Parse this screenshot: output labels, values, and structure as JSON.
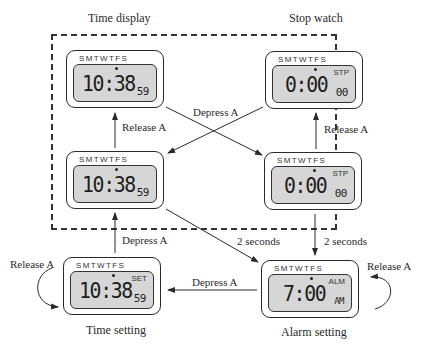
{
  "diagram": {
    "title_left": "Time display",
    "title_right": "Stop watch",
    "caption_time_setting": "Time setting",
    "caption_alarm_setting": "Alarm setting"
  },
  "watches": {
    "time_display": {
      "days": "SMTWTFS",
      "mode": "",
      "main": "10:38",
      "sub": "59"
    },
    "stopwatch_top": {
      "days": "SMTWTFS",
      "mode": "STP",
      "main": "0:00",
      "sub": "00"
    },
    "time_display_depressed": {
      "days": "SMTWTFS",
      "mode": "",
      "main": "10:38",
      "sub": "59"
    },
    "stopwatch_depressed": {
      "days": "SMTWTFS",
      "mode": "STP",
      "main": "0:00",
      "sub": "00"
    },
    "time_setting": {
      "days": "SMTWTFS",
      "mode": "SET",
      "main": "10:38",
      "sub": "59"
    },
    "alarm_setting": {
      "days": "SMTWTFS",
      "mode": "ALM",
      "main": "7:00",
      "sub": "AM"
    }
  },
  "transitions": {
    "release_a_left": "Release A",
    "release_a_right": "Release A",
    "depress_a_cross": "Depress A",
    "depress_a_bottom_left": "Depress A",
    "two_seconds_diag": "2 seconds",
    "two_seconds_right": "2 seconds",
    "depress_a_bottom": "Depress A",
    "release_a_loop_left": "Release A",
    "release_a_loop_right": "Release A"
  },
  "colors": {
    "lcd": "#d6d6d6",
    "stroke": "#2a2a2a",
    "background": "#ffffff"
  }
}
